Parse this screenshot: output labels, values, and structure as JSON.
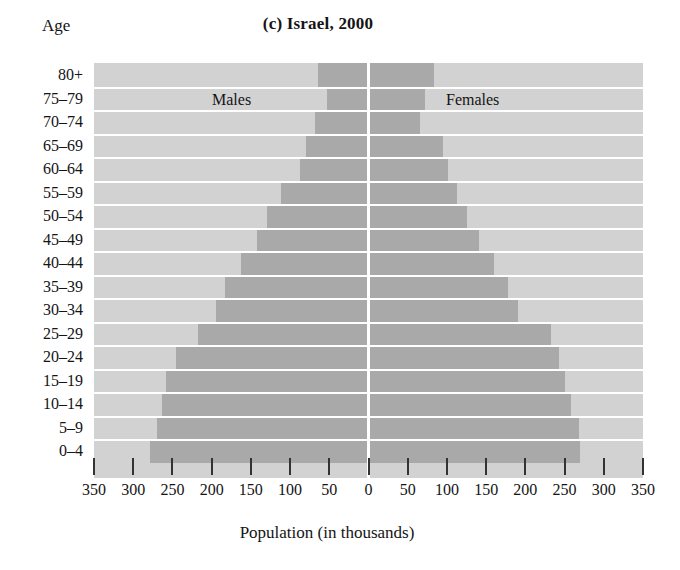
{
  "chart_data": {
    "type": "bar",
    "subtype": "population-pyramid",
    "title": "(c) Israel, 2000",
    "xlabel": "Population (in thousands)",
    "ylabel": "Age",
    "grid": false,
    "legend_position": "inside-plot",
    "axis_max": 350,
    "xticks": [
      350,
      300,
      250,
      200,
      150,
      100,
      50,
      0,
      50,
      100,
      150,
      200,
      250,
      300,
      350
    ],
    "categories": [
      "80+",
      "75–79",
      "70–74",
      "65–69",
      "60–64",
      "55–59",
      "50–54",
      "45–49",
      "40–44",
      "35–39",
      "30–34",
      "25–29",
      "20–24",
      "15–19",
      "10–14",
      "5–9",
      "0–4"
    ],
    "series": [
      {
        "name": "Males",
        "side": "left",
        "values": [
          64,
          53,
          68,
          80,
          87,
          112,
          129,
          142,
          162,
          183,
          195,
          218,
          246,
          258,
          263,
          270,
          278
        ]
      },
      {
        "name": "Females",
        "side": "right",
        "values": [
          84,
          72,
          66,
          95,
          101,
          113,
          125,
          141,
          160,
          178,
          191,
          233,
          243,
          250,
          258,
          268,
          270
        ]
      }
    ]
  },
  "labels": {
    "age_axis_title": "Age",
    "x_axis_title": "Population (in thousands)",
    "males_caption": "Males",
    "females_caption": "Females"
  },
  "colors": {
    "plot_background": "#d2d2d2",
    "bar_fill": "#a9a9a9",
    "center_line": "#ffffff",
    "row_separator": "#ffffff",
    "tick_mark": "#333333",
    "text": "#141414",
    "page_background": "#ffffff"
  }
}
